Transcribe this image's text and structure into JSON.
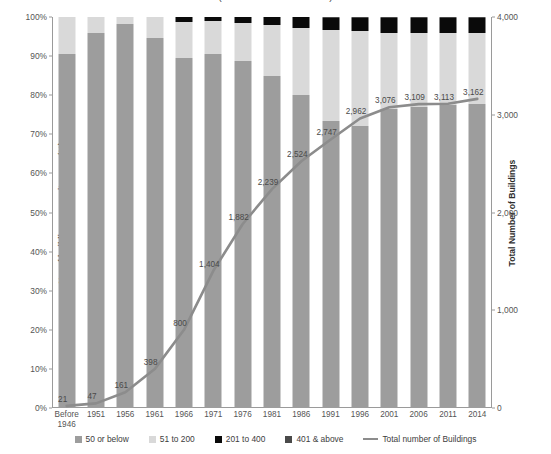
{
  "title": "(As at 31 December 2014)",
  "axes": {
    "left": {
      "label": "No. of buildings per unit group (%)",
      "ticks": [
        "0%",
        "10%",
        "20%",
        "30%",
        "40%",
        "50%",
        "60%",
        "70%",
        "80%",
        "90%",
        "100%"
      ]
    },
    "right": {
      "label": "Total Number of Buildings",
      "ticks": [
        "0",
        "1,000",
        "2,000",
        "3,000",
        "4,000"
      ]
    }
  },
  "legend": [
    {
      "label": "50 or below",
      "color": "#9d9d9d",
      "type": "swatch"
    },
    {
      "label": "51 to 200",
      "color": "#d9d9d9",
      "type": "swatch"
    },
    {
      "label": "201 to 400",
      "color": "#0a0a0a",
      "type": "swatch"
    },
    {
      "label": "401 & above",
      "color": "#4a4a4a",
      "type": "swatch"
    },
    {
      "label": "Total number of Buildings",
      "color": "#8c8c8c",
      "type": "line"
    }
  ],
  "chart_data": {
    "type": "bar",
    "title": "(As at 31 December 2014)",
    "xlabel": "",
    "ylabel": "No. of buildings per unit group (%)",
    "y2label": "Total Number of Buildings",
    "ylim": [
      0,
      100
    ],
    "y2lim": [
      0,
      4000
    ],
    "grid": false,
    "legend_position": "bottom",
    "stacked": true,
    "stack_mode": "percent",
    "categories": [
      "Before 1946",
      "1951",
      "1956",
      "1961",
      "1966",
      "1971",
      "1976",
      "1981",
      "1986",
      "1991",
      "1996",
      "2001",
      "2006",
      "2011",
      "2014"
    ],
    "series": [
      {
        "name": "50 or below",
        "color": "#9d9d9d",
        "axis": "left",
        "values": [
          90.5,
          95.9,
          98.2,
          94.7,
          89.5,
          90.6,
          88.8,
          85.0,
          80.0,
          73.5,
          72.0,
          76.5,
          77.0,
          77.5,
          77.8
        ]
      },
      {
        "name": "51 to 200",
        "color": "#d9d9d9",
        "axis": "left",
        "values": [
          9.5,
          4.1,
          1.8,
          5.3,
          9.3,
          8.3,
          9.7,
          12.9,
          17.2,
          23.3,
          24.5,
          19.5,
          18.8,
          18.3,
          18.0
        ]
      },
      {
        "name": "201 to 400",
        "color": "#0a0a0a",
        "axis": "left",
        "values": [
          0.0,
          0.0,
          0.0,
          0.0,
          1.2,
          1.1,
          1.5,
          2.1,
          2.8,
          3.0,
          3.3,
          3.8,
          4.0,
          4.0,
          4.0
        ]
      },
      {
        "name": "401 & above",
        "color": "#4a4a4a",
        "axis": "left",
        "values": [
          0.0,
          0.0,
          0.0,
          0.0,
          0.0,
          0.0,
          0.0,
          0.0,
          0.0,
          0.2,
          0.2,
          0.2,
          0.2,
          0.2,
          0.2
        ]
      },
      {
        "name": "Total number of Buildings",
        "color": "#8c8c8c",
        "axis": "right",
        "type": "line",
        "values": [
          21,
          47,
          161,
          398,
          800,
          1404,
          1882,
          2239,
          2524,
          2747,
          2962,
          3076,
          3109,
          3113,
          3162
        ],
        "labels": [
          "21",
          "47",
          "161",
          "398",
          "800",
          "1,404",
          "1,882",
          "2,239",
          "2,524",
          "2,747",
          "2,962",
          "3,076",
          "3,109",
          "3,113",
          "3,162"
        ]
      }
    ]
  }
}
